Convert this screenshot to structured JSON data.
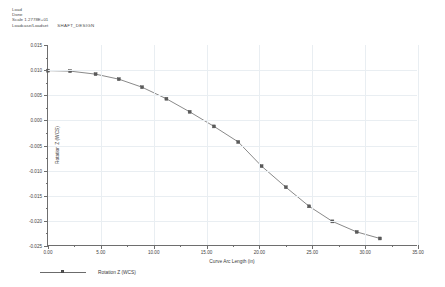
{
  "header": {
    "lines": [
      {
        "text": "Load"
      },
      {
        "text": "Done"
      },
      {
        "text": "Scale  1.2778E+01"
      },
      {
        "text": "Loadcase/Loadset",
        "name": "SHAFT_DESIGN"
      }
    ]
  },
  "legend": {
    "items": [
      {
        "label": "Rotation Z (WCS)",
        "color": "#6b6b6b",
        "marker": "square"
      }
    ],
    "position": "below-axis-left"
  },
  "colors": {
    "series_line": "#6b6b6b",
    "marker_fill": "#5a5a5a",
    "grid": "#e9eef2",
    "axis": "#6e6e6e",
    "text": "#3a3a3a",
    "background": "#ffffff"
  },
  "chart_data": {
    "type": "line",
    "title": "",
    "subtitle": "",
    "xlabel": "Curve Arc Length (in)",
    "ylabel": "Rotation Z (WCS)",
    "xlim": [
      0.0,
      35.0
    ],
    "ylim": [
      -0.025,
      0.015
    ],
    "xticks": [
      0.0,
      5.0,
      10.0,
      15.0,
      20.0,
      25.0,
      30.0,
      35.0
    ],
    "xticklabels": [
      "0.00",
      "5.00",
      "10.00",
      "15.00",
      "20.00",
      "25.00",
      "30.00",
      "35.00"
    ],
    "yticks": [
      0.015,
      0.01,
      0.005,
      0.0,
      -0.005,
      -0.01,
      -0.015,
      -0.02,
      -0.025
    ],
    "yticklabels": [
      "0.015",
      "0.010",
      "0.005",
      "0.000",
      "-0.005",
      "-0.010",
      "-0.015",
      "-0.020",
      "-0.025"
    ],
    "minor_ticks": true,
    "grid": true,
    "legend_position": "bottom-left",
    "markers": "square",
    "series": [
      {
        "name": "Rotation Z (WCS)",
        "color": "#6b6b6b",
        "x": [
          0.0,
          2.1,
          4.5,
          6.7,
          8.9,
          11.2,
          13.4,
          15.7,
          18.0,
          20.2,
          22.5,
          24.7,
          26.9,
          29.2,
          31.4
        ],
        "y": [
          0.0099,
          0.0098,
          0.0092,
          0.0082,
          0.0066,
          0.0043,
          0.0017,
          -0.0012,
          -0.0043,
          -0.0091,
          -0.0133,
          -0.0171,
          -0.0201,
          -0.0222,
          -0.0235
        ]
      }
    ]
  }
}
